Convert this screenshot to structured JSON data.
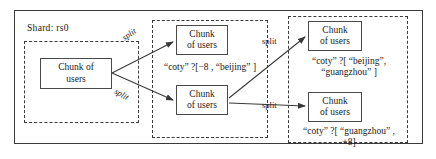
{
  "diagram": {
    "shard_label": "Shard:  rs0",
    "stages": [
      {
        "name": "stage-initial"
      },
      {
        "name": "stage-first-split"
      },
      {
        "name": "stage-second-split"
      }
    ],
    "chunks": [
      {
        "id": "chunk-left",
        "line1": "Chunk of",
        "line2": "users"
      },
      {
        "id": "chunk-m-top",
        "line1": "Chunk",
        "line2": "of users"
      },
      {
        "id": "chunk-m-bot",
        "line1": "Chunk",
        "line2": "of users"
      },
      {
        "id": "chunk-r-top",
        "line1": "Chunk",
        "line2": "of users"
      },
      {
        "id": "chunk-r-bot",
        "line1": "Chunk",
        "line2": "of users"
      }
    ],
    "ranges": {
      "middle": "“coty” ?[−8 , “beijing” ]",
      "right_top_line1": "“coty” ?[ “beijing”,",
      "right_top_line2": "“guangzhou”  ]",
      "right_bottom_line1": "“coty” ?[ “guangzhou” ,",
      "right_bottom_line2": "+8]"
    },
    "edges": [
      {
        "id": "split-a",
        "label": "split"
      },
      {
        "id": "split-b",
        "label": "split"
      },
      {
        "id": "split-c",
        "label": "split"
      },
      {
        "id": "split-d",
        "label": "split"
      }
    ],
    "colors": {
      "stroke": "#3a3a3a",
      "box_stroke": "#4a4a4a",
      "text": "#1a1a1a",
      "background": "#ffffff"
    }
  }
}
